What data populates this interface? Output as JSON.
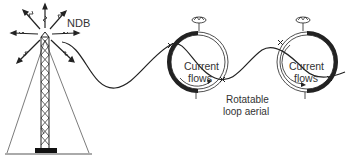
{
  "diagram": {
    "type": "NDB and rotatable loop aerial illustration",
    "labels": {
      "ndb": "NDB",
      "loop1_line1": "Current",
      "loop1_line2": "flows",
      "loop2_line1": "Current",
      "loop2_line2": "flows",
      "aerial_line1": "Rotatable",
      "aerial_line2": "loop aerial"
    },
    "components": [
      {
        "id": "ndb-tower",
        "description": "Lattice radio mast with guy wires radiating signal arrows"
      },
      {
        "id": "radio-wave",
        "description": "Sinusoidal wave travelling from the NDB to the loops"
      },
      {
        "id": "loop-aerial-1",
        "description": "Loop aerial with thick current arc on left side"
      },
      {
        "id": "loop-aerial-2",
        "description": "Loop aerial with thick current arc on right side"
      }
    ],
    "colors": {
      "line": "#222222",
      "text": "#333333",
      "ground": "#999999",
      "background": "#ffffff"
    }
  }
}
